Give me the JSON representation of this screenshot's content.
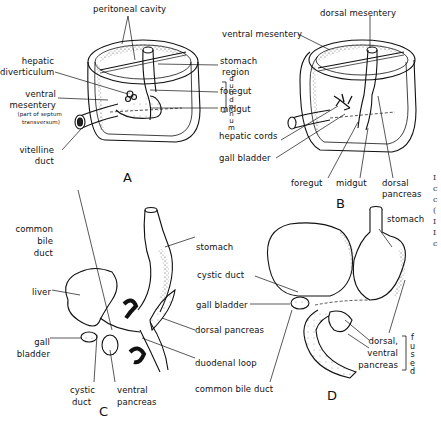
{
  "figure": {
    "panels": [
      {
        "id": "A",
        "label": "A",
        "labels": {
          "peritoneal_cavity": "peritoneal cavity",
          "hepatic_diverticulum_1": "hepatic",
          "hepatic_diverticulum_2": "diverticulum",
          "ventral_mesentery_1": "ventral",
          "ventral_mesentery_2": "mesentery",
          "ventral_mesentery_note_1": "(part of septum",
          "ventral_mesentery_note_2": "transversum)",
          "vitelline_duct_1": "vitelline",
          "vitelline_duct_2": "duct",
          "stomach_region_1": "stomach",
          "stomach_region_2": "region",
          "foregut": "foregut",
          "midgut": "midgut",
          "duodenum_vertical": "duodenum"
        }
      },
      {
        "id": "B",
        "label": "B",
        "labels": {
          "dorsal_mesentery": "dorsal mesentery",
          "ventral_mesentery": "ventral mesentery",
          "hepatic_cords": "hepatic cords",
          "gall_bladder": "gall bladder",
          "foregut": "foregut",
          "midgut": "midgut",
          "dorsal_pancreas_1": "dorsal",
          "dorsal_pancreas_2": "pancreas"
        }
      },
      {
        "id": "C",
        "label": "C",
        "labels": {
          "common_bile_duct_1": "common",
          "common_bile_duct_2": "bile",
          "common_bile_duct_3": "duct",
          "liver": "liver",
          "gall_bladder_1": "gall",
          "gall_bladder_2": "bladder",
          "cystic_duct_1": "cystic",
          "cystic_duct_2": "duct",
          "ventral_pancreas_1": "ventral",
          "ventral_pancreas_2": "pancreas",
          "stomach": "stomach",
          "dorsal_pancreas": "dorsal pancreas",
          "duodenal_loop": "duodenal loop"
        }
      },
      {
        "id": "D",
        "label": "D",
        "labels": {
          "stomach": "stomach",
          "cystic_duct": "cystic duct",
          "gall_bladder": "gall bladder",
          "common_bile_duct": "common bile duct",
          "dorsal_ventral_1": "dorsal,",
          "dorsal_ventral_2": "ventral",
          "dorsal_ventral_3": "pancreas",
          "fused_vertical": "fused",
          "foregut_inline": "foregut",
          "midgut_inline": "midgut"
        }
      }
    ],
    "edge_fragments": [
      "I",
      "c",
      "c",
      "(",
      "I",
      "I",
      "c"
    ],
    "colors": {
      "ink": "#111111",
      "stipple": "#555555",
      "background": "#ffffff"
    }
  }
}
